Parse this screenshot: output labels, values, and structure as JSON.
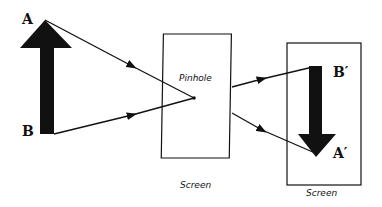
{
  "diagram": {
    "object": {
      "top_label": "A",
      "bottom_label": "B",
      "direction": "up"
    },
    "pinhole_screen": {
      "label": "Pinhole",
      "caption": "Screen"
    },
    "image_screen": {
      "top_label": "B′",
      "bottom_label": "A′",
      "caption": "Screen",
      "direction": "down"
    },
    "colors": {
      "ink": "#111111",
      "background": "#ffffff"
    }
  }
}
